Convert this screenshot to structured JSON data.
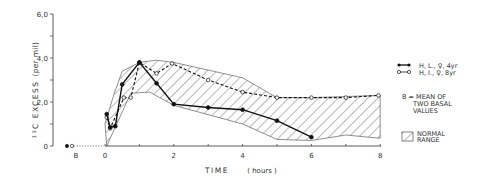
{
  "chart_data": {
    "type": "line",
    "title": "",
    "xlabel": "TIME ( hours )",
    "ylabel": "13C EXCESS (per mil)",
    "ylabel_superscript": "13",
    "ylabel_main": "C EXCESS",
    "ylabel_unit": "(per mil)",
    "xlim": [
      0,
      8
    ],
    "ylim": [
      0,
      6
    ],
    "x_ticks": [
      0,
      1,
      2,
      3,
      4,
      5,
      6,
      7,
      8
    ],
    "x_tick_labels": [
      "0",
      "2",
      "4",
      "6",
      "8"
    ],
    "x_tick_label_values": [
      0,
      2,
      4,
      6,
      8
    ],
    "y_ticks": [
      0,
      1,
      2,
      3,
      4,
      5,
      6
    ],
    "y_tick_labels": [
      "0",
      "2,0",
      "4,0",
      "6,0"
    ],
    "y_tick_label_values": [
      0,
      2,
      4,
      6
    ],
    "baseline_label": "B",
    "grid": false,
    "legend_position": "right",
    "series": [
      {
        "name": "H, L., ♀, 4yr",
        "style": "solid-filled-markers",
        "x": [
          0.05,
          0.15,
          0.3,
          0.5,
          1.0,
          1.5,
          2.0,
          3.0,
          4.0,
          5.0,
          6.0
        ],
        "values": [
          1.45,
          0.85,
          0.9,
          2.8,
          3.8,
          2.85,
          1.9,
          1.75,
          1.65,
          1.15,
          0.4
        ]
      },
      {
        "name": "H, I., ♀, 8yr",
        "style": "dashed-open-markers",
        "x": [
          0.05,
          0.15,
          0.55,
          0.75,
          1.0,
          1.5,
          1.95,
          3.0,
          4.0,
          5.0,
          6.0,
          7.0,
          7.95
        ],
        "values": [
          1.3,
          0.8,
          2.2,
          2.2,
          3.8,
          3.3,
          3.75,
          3.0,
          2.45,
          2.2,
          2.2,
          2.2,
          2.3
        ]
      }
    ],
    "baseline_points": [
      {
        "name": "B (filled)",
        "value": 0
      },
      {
        "name": "B (open)",
        "value": 0
      }
    ],
    "normal_range": {
      "upper": {
        "x": [
          0,
          0.25,
          0.5,
          1.0,
          1.5,
          2.0,
          4.0,
          5.0,
          6.0,
          8.0
        ],
        "values": [
          1.0,
          2.3,
          3.4,
          3.8,
          3.9,
          3.8,
          3.1,
          2.2,
          2.2,
          2.3
        ]
      },
      "lower": {
        "x": [
          0.05,
          0.75,
          1.3,
          2.0,
          4.0,
          5.0,
          6.0,
          7.0,
          8.0
        ],
        "values": [
          0.0,
          2.4,
          2.45,
          1.85,
          1.0,
          0.3,
          0.25,
          0.5,
          0.35
        ]
      }
    },
    "annotations": [
      "B = MEAN OF TWO BASAL VALUES",
      "NORMAL RANGE"
    ]
  },
  "legend": {
    "items": [
      {
        "label": "H, L., ♀, 4yr",
        "marker": "filled"
      },
      {
        "label": "H, I., ♀, 8yr",
        "marker": "open"
      }
    ],
    "note_line1": "B = MEAN OF",
    "note_line2": "TWO BASAL",
    "note_line3": "VALUES",
    "range_line1": "NORMAL",
    "range_line2": "RANGE"
  },
  "axes": {
    "x_title": "TIME",
    "x_unit": "( hours )",
    "y_sup": "13",
    "y_title": "C EXCESS",
    "y_unit": "(per mil)",
    "b_label": "B"
  }
}
